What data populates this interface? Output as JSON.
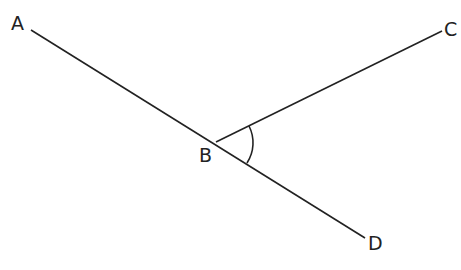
{
  "diagram": {
    "type": "geometry-angle",
    "points": {
      "A": {
        "label": "A",
        "x": 31,
        "y": 30
      },
      "B": {
        "label": "B",
        "x": 216,
        "y": 142
      },
      "C": {
        "label": "C",
        "x": 442,
        "y": 31
      },
      "D": {
        "label": "D",
        "x": 365,
        "y": 238
      }
    },
    "segments": [
      {
        "from": "A",
        "to": "D",
        "name": "line-AD"
      },
      {
        "from": "B",
        "to": "C",
        "name": "ray-BC"
      }
    ],
    "marked_angle": {
      "vertex": "B",
      "between": [
        "C",
        "D"
      ],
      "label": "angle CBD"
    },
    "stroke_color": "#222222"
  }
}
